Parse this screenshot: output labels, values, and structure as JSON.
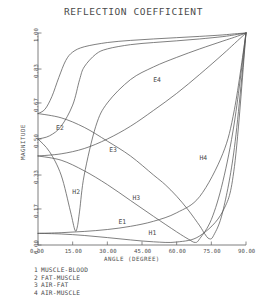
{
  "chart_data": {
    "type": "line",
    "title": "REFLECTION COEFFICIENT",
    "xlabel": "ANGLE (DEGREE)",
    "ylabel": "MAGNITUDE",
    "xlim": [
      0,
      90
    ],
    "ylim": [
      0,
      1
    ],
    "grid": false,
    "legend_position": "below-axes",
    "xticks": [
      "0.00",
      "15.00",
      "30.00",
      "45.00",
      "60.00",
      "75.00",
      "90.00"
    ],
    "xtick_values": [
      0,
      15,
      30,
      45,
      60,
      75,
      90
    ],
    "yticks": [
      "1.00",
      "0.83",
      "0.67",
      "0.50",
      "0.33",
      "0.17",
      "0.00"
    ],
    "ytick_values": [
      1.0,
      0.83,
      0.67,
      0.5,
      0.33,
      0.17,
      0.0
    ],
    "annotations": [
      {
        "text": "E4",
        "x": 52,
        "y": 0.78
      },
      {
        "text": "E2",
        "x": 10,
        "y": 0.55
      },
      {
        "text": "E3",
        "x": 33,
        "y": 0.45
      },
      {
        "text": "H4",
        "x": 72,
        "y": 0.41
      },
      {
        "text": "H2",
        "x": 17,
        "y": 0.25
      },
      {
        "text": "H3",
        "x": 43,
        "y": 0.22
      },
      {
        "text": "E1",
        "x": 37,
        "y": 0.11
      },
      {
        "text": "H1",
        "x": 50,
        "y": 0.055
      }
    ],
    "legend": [
      {
        "key": "1",
        "label": "MUSCLE-BLOOD"
      },
      {
        "key": "2",
        "label": "FAT-MUSCLE"
      },
      {
        "key": "3",
        "label": "AIR-FAT"
      },
      {
        "key": "4",
        "label": "AIR-MUSCLE"
      }
    ],
    "series": [
      {
        "name": "E1",
        "interface": "MUSCLE-BLOOD",
        "polarization": "E",
        "x": [
          0,
          10,
          20,
          30,
          40,
          50,
          60,
          70,
          80,
          85,
          90
        ],
        "y": [
          0.055,
          0.058,
          0.064,
          0.073,
          0.088,
          0.112,
          0.152,
          0.229,
          0.432,
          0.64,
          1.0
        ]
      },
      {
        "name": "H1",
        "interface": "MUSCLE-BLOOD",
        "polarization": "H",
        "x": [
          0,
          10,
          20,
          30,
          40,
          50,
          60,
          70,
          80,
          85,
          90
        ],
        "y": [
          0.055,
          0.052,
          0.045,
          0.035,
          0.024,
          0.015,
          0.014,
          0.043,
          0.16,
          0.37,
          1.0
        ]
      },
      {
        "name": "E2",
        "interface": "FAT-MUSCLE",
        "polarization": "E",
        "x": [
          0,
          5,
          10,
          15,
          18,
          20,
          25,
          30,
          40,
          50,
          60,
          70,
          80,
          85,
          90
        ],
        "y": [
          0.5,
          0.515,
          0.56,
          0.66,
          0.78,
          0.84,
          0.9,
          0.925,
          0.945,
          0.955,
          0.963,
          0.972,
          0.983,
          0.991,
          1.0
        ]
      },
      {
        "name": "H2",
        "interface": "FAT-MUSCLE",
        "polarization": "H",
        "x": [
          0,
          5,
          10,
          14,
          16,
          17,
          18,
          20,
          25,
          30,
          40,
          50,
          60,
          70,
          80,
          85,
          90
        ],
        "y": [
          0.5,
          0.44,
          0.33,
          0.16,
          0.07,
          0.085,
          0.16,
          0.33,
          0.56,
          0.67,
          0.78,
          0.84,
          0.885,
          0.925,
          0.962,
          0.98,
          1.0
        ]
      },
      {
        "name": "E3",
        "interface": "AIR-FAT",
        "polarization": "E",
        "x": [
          0,
          10,
          20,
          30,
          40,
          50,
          60,
          70,
          80,
          85,
          90
        ],
        "y": [
          0.42,
          0.43,
          0.455,
          0.5,
          0.56,
          0.635,
          0.715,
          0.805,
          0.9,
          0.95,
          1.0
        ]
      },
      {
        "name": "H3",
        "interface": "AIR-FAT",
        "polarization": "H",
        "x": [
          0,
          10,
          20,
          30,
          40,
          50,
          60,
          65,
          68,
          70,
          75,
          80,
          85,
          90
        ],
        "y": [
          0.42,
          0.4,
          0.35,
          0.285,
          0.21,
          0.135,
          0.062,
          0.028,
          0.012,
          0.03,
          0.12,
          0.3,
          0.58,
          1.0
        ]
      },
      {
        "name": "E4",
        "interface": "AIR-MUSCLE",
        "polarization": "E",
        "x": [
          0,
          3,
          6,
          9,
          12,
          15,
          20,
          30,
          40,
          50,
          60,
          70,
          80,
          85,
          90
        ],
        "y": [
          0.62,
          0.64,
          0.7,
          0.79,
          0.87,
          0.91,
          0.935,
          0.955,
          0.965,
          0.972,
          0.978,
          0.984,
          0.991,
          0.996,
          1.0
        ]
      },
      {
        "name": "H4",
        "interface": "AIR-MUSCLE",
        "polarization": "H",
        "x": [
          0,
          10,
          20,
          30,
          40,
          50,
          55,
          60,
          65,
          70,
          72,
          74,
          76,
          80,
          85,
          90
        ],
        "y": [
          0.62,
          0.6,
          0.555,
          0.49,
          0.42,
          0.33,
          0.285,
          0.23,
          0.165,
          0.09,
          0.055,
          0.03,
          0.045,
          0.16,
          0.46,
          1.0
        ]
      }
    ]
  }
}
